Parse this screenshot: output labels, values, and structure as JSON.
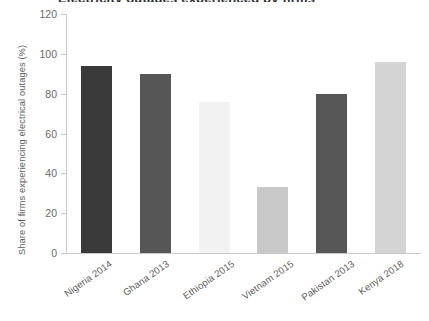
{
  "chart_data": {
    "type": "bar",
    "title": "Electricity outages experienced by firms",
    "xlabel": "",
    "ylabel": "Share of firms experiencing electrical outages (%)",
    "categories": [
      "Nigeria 2014",
      "Ghana 2013",
      "Ethiopia 2015",
      "Vietnam 2015",
      "Pakistan 2013",
      "Kenya 2018"
    ],
    "values": [
      94,
      90,
      76,
      33,
      80,
      96
    ],
    "bar_colors": [
      "#3a3a3a",
      "#565656",
      "#f2f2f2",
      "#c8c8c8",
      "#575757",
      "#d4d4d4"
    ],
    "ylim": [
      0,
      120
    ],
    "yticks": [
      0,
      20,
      40,
      60,
      80,
      100,
      120
    ],
    "ytick_labels": [
      "0",
      "20",
      "40",
      "60",
      "80",
      "100",
      "120"
    ],
    "grid": false,
    "legend": "none",
    "axis_color": "#c9c9c9",
    "text_color": "#5d5d5d",
    "background": "#ffffff"
  }
}
